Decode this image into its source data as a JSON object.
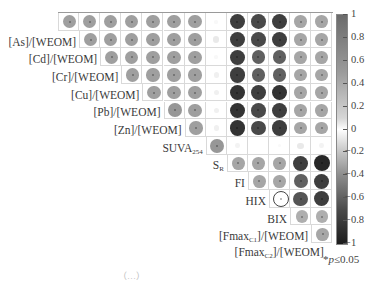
{
  "chart_data": {
    "type": "heatmap",
    "subtype": "correlation-matrix-upper-circles",
    "title": "",
    "variables": [
      "",
      "[As]/[WEOM]",
      "[Cd]/[WEOM]",
      "[Cr]/[WEOM]",
      "[Cu]/[WEOM]",
      "[Pb]/[WEOM]",
      "[Zn]/[WEOM]",
      "SUVA254",
      "SR",
      "FI",
      "HIX",
      "BIX",
      "[Fmax C1]/[WEOM]",
      "[Fmax C2]/[WEOM]"
    ],
    "row_labels": [
      {
        "main": "",
        "sub": ""
      },
      {
        "main": "[As]/[WEOM]",
        "sub": ""
      },
      {
        "main": "[Cd]/[WEOM]",
        "sub": ""
      },
      {
        "main": "[Cr]/[WEOM]",
        "sub": ""
      },
      {
        "main": "[Cu]/[WEOM]",
        "sub": ""
      },
      {
        "main": "[Pb]/[WEOM]",
        "sub": ""
      },
      {
        "main": "[Zn]/[WEOM]",
        "sub": ""
      },
      {
        "main": "SUVA",
        "sub": "254"
      },
      {
        "main": "S",
        "sub": "R"
      },
      {
        "main": "FI",
        "sub": ""
      },
      {
        "main": "HIX",
        "sub": ""
      },
      {
        "main": "BIX",
        "sub": ""
      },
      {
        "main": "[Fmax",
        "sub": "C1",
        "tail": "]/[WEOM]"
      },
      {
        "main": "[Fmax",
        "sub": "C2",
        "tail": "]/[WEOM]"
      }
    ],
    "values": [
      [
        0.65,
        0.65,
        0.65,
        0.65,
        0.65,
        0.65,
        0.65,
        0.05,
        -0.85,
        -0.8,
        -0.85,
        0.6,
        0.6
      ],
      [
        0.65,
        0.65,
        0.65,
        0.65,
        0.65,
        0.65,
        0.15,
        -0.85,
        -0.8,
        -0.85,
        0.6,
        0.6
      ],
      [
        0.65,
        0.65,
        0.65,
        0.65,
        0.65,
        0.05,
        -0.85,
        -0.7,
        -0.7,
        0.6,
        0.6
      ],
      [
        0.65,
        0.65,
        0.65,
        0.65,
        0.1,
        -0.85,
        -0.7,
        -0.7,
        0.6,
        0.6
      ],
      [
        0.65,
        0.65,
        0.65,
        0.1,
        -0.9,
        -0.85,
        -0.9,
        0.6,
        0.6
      ],
      [
        0.7,
        0.65,
        0.1,
        -0.9,
        -0.8,
        -0.85,
        0.6,
        0.6
      ],
      [
        0.65,
        0.1,
        -0.9,
        -0.8,
        -0.85,
        0.6,
        0.6
      ],
      [
        0.7,
        0.08,
        0.0,
        0.04,
        0.15,
        0.08
      ],
      [
        0.6,
        0.6,
        0.6,
        -0.85,
        -0.95
      ],
      [
        0.6,
        0.6,
        -0.7,
        -0.85
      ],
      [
        0.02,
        -0.75,
        -0.85
      ],
      [
        0.55,
        0.55
      ],
      [
        0.6
      ]
    ],
    "significance_marker": "*",
    "significance_note": "p ≤ 0.05",
    "colorbar": {
      "ticks": [
        "1",
        "0.8",
        "0.6",
        "0.4",
        "0.2",
        "0",
        "-0.2",
        "-0.4",
        "-0.6",
        "-0.8",
        "-1"
      ],
      "range": [
        -1,
        1
      ],
      "positive_color": "#6b6b6b",
      "zero_color": "#ffffff",
      "negative_color": "#1c1c1c"
    },
    "grid": true,
    "legend_position": "right"
  },
  "legend": {
    "star": "*",
    "p": "p",
    "text": "≤0.05"
  },
  "caption_partial": "（…）"
}
